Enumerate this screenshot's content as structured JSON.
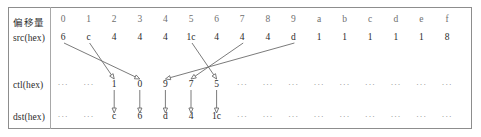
{
  "figure": {
    "title": "",
    "columns_count": 16,
    "grid": {
      "first_column_x": 63,
      "column_step": 25.6,
      "rows": [
        {
          "key": "offset",
          "label": "偏移量",
          "y": 21,
          "style": "header"
        },
        {
          "key": "src",
          "label": "src(hex)",
          "y": 39,
          "style": "data"
        },
        {
          "key": "ctl",
          "label": "ctl(hex)",
          "y": 86,
          "style": "data"
        },
        {
          "key": "dst",
          "label": "dst(hex)",
          "y": 118,
          "style": "data"
        }
      ]
    },
    "rows": {
      "offset": {
        "label": "偏移量",
        "values": [
          "0",
          "1",
          "2",
          "3",
          "4",
          "5",
          "6",
          "7",
          "8",
          "9",
          "a",
          "b",
          "c",
          "d",
          "e",
          "f"
        ]
      },
      "src": {
        "label": "src(hex)",
        "values": [
          "6",
          "c",
          "4",
          "4",
          "4",
          "1c",
          "4",
          "4",
          "4",
          "d",
          "1",
          "1",
          "1",
          "1",
          "1",
          "8"
        ]
      },
      "ctl": {
        "label": "ctl(hex)",
        "values": [
          "···",
          "···",
          "1",
          "0",
          "9",
          "7",
          "5",
          "···",
          "···",
          "···",
          "···",
          "···",
          "···",
          "···",
          "···",
          "···"
        ]
      },
      "dst": {
        "label": "dst(hex)",
        "values": [
          "···",
          "···",
          "c",
          "6",
          "d",
          "4",
          "1c",
          "···",
          "···",
          "···",
          "···",
          "···",
          "···",
          "···",
          "···",
          "···"
        ]
      }
    },
    "mappings": {
      "src_to_ctl": [
        {
          "from_column": 0,
          "to_column": 3,
          "from_value": "6",
          "to_value": "0"
        },
        {
          "from_column": 1,
          "to_column": 2,
          "from_value": "c",
          "to_value": "1"
        },
        {
          "from_column": 5,
          "to_column": 6,
          "from_value": "1c",
          "to_value": "5"
        },
        {
          "from_column": 7,
          "to_column": 5,
          "from_value": "4",
          "to_value": "7"
        },
        {
          "from_column": 9,
          "to_column": 4,
          "from_value": "d",
          "to_value": "9"
        }
      ],
      "ctl_to_dst": [
        {
          "column": 2,
          "from_value": "1",
          "to_value": "c"
        },
        {
          "column": 3,
          "from_value": "0",
          "to_value": "6"
        },
        {
          "column": 4,
          "from_value": "9",
          "to_value": "d"
        },
        {
          "column": 5,
          "from_value": "7",
          "to_value": "4"
        },
        {
          "column": 6,
          "from_value": "5",
          "to_value": "1c"
        }
      ]
    },
    "colors": {
      "text": "#2b2b2b",
      "header_text": "#6f6f6f",
      "ellipsis_text": "#8a8a8a",
      "border": "#8d8d8d",
      "arrow": "#6c6c6c",
      "background": "#ffffff"
    }
  }
}
